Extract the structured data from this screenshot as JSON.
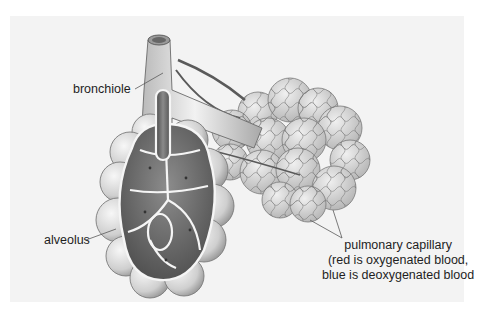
{
  "diagram": {
    "background_color": "#f3f3f3",
    "labels": {
      "bronchiole": "bronchiole",
      "alveolus": "alveolus",
      "pulmonary_capillary": {
        "line1": "pulmonary capillary",
        "line2": "(red is oxygenated blood,",
        "line3": "blue is deoxygenated blood"
      }
    }
  }
}
